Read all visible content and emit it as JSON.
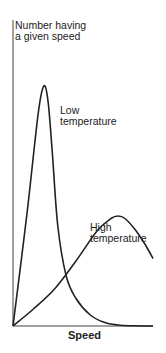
{
  "chart_data": {
    "type": "line",
    "title": "",
    "xlabel": "Speed",
    "ylabel": "Number having a given speed",
    "ylabel_lines": [
      "Number having",
      "a given speed"
    ],
    "xlim": [
      0,
      10
    ],
    "ylim": [
      0,
      10
    ],
    "grid": false,
    "ticks": "none",
    "series": [
      {
        "name": "Low temperature",
        "label_lines": [
          "Low",
          "temperature"
        ],
        "x": [
          0,
          1.0,
          1.8,
          2.2,
          2.5,
          2.8,
          3.2,
          3.8,
          4.5,
          5.5,
          6.5,
          7.5,
          8.5,
          10
        ],
        "y": [
          0,
          4.5,
          8.5,
          9.6,
          9.0,
          7.0,
          4.0,
          2.0,
          1.1,
          0.45,
          0.15,
          0.04,
          0.01,
          0
        ]
      },
      {
        "name": "High temperature",
        "label_lines": [
          "High",
          "temperature"
        ],
        "x": [
          0,
          1.5,
          3.0,
          4.5,
          6.0,
          7.0,
          7.5,
          8.0,
          8.8,
          9.5,
          10
        ],
        "y": [
          0,
          0.7,
          1.5,
          2.6,
          3.8,
          4.3,
          4.4,
          4.3,
          3.8,
          3.2,
          2.7
        ]
      }
    ]
  }
}
